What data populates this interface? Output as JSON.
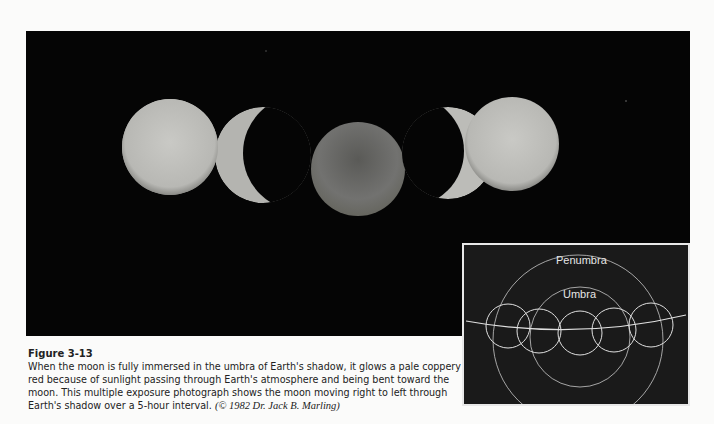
{
  "figure": {
    "title": "Figure 3-13",
    "caption": "When the moon is fully immersed in the umbra of Earth's shadow, it glows a pale coppery red because of sunlight passing through Earth's atmosphere and being bent toward the moon. This multiple exposure photograph shows the moon moving right to left through Earth's shadow over a 5-hour interval.",
    "credit": "(© 1982 Dr. Jack B. Marling)"
  },
  "photo": {
    "description": "Multiple exposure of lunar eclipse: five moon phases from left to right",
    "colors": {
      "background": "#050505",
      "bright_moon": "#c8c8c4",
      "eclipsed_moon": "#6e6e6a"
    }
  },
  "inset": {
    "labels": {
      "outer": "Penumbra",
      "inner": "Umbra"
    },
    "colors": {
      "background": "#1a1a1a",
      "lines": "#d8d8d8"
    }
  }
}
